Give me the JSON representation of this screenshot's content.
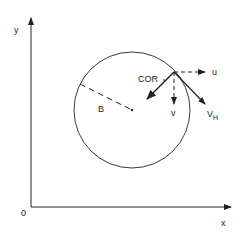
{
  "diagram": {
    "axes": {
      "y_label": "y",
      "x_label": "x",
      "origin_label": "0"
    },
    "circle": {
      "radius_label": "B"
    },
    "point": {
      "label": "COR"
    },
    "vectors": {
      "u_label": "u",
      "v_label": "v",
      "vh_label": "V",
      "vh_subscript": "H"
    },
    "colors": {
      "stroke": "#222222",
      "background": "#ffffff"
    }
  }
}
